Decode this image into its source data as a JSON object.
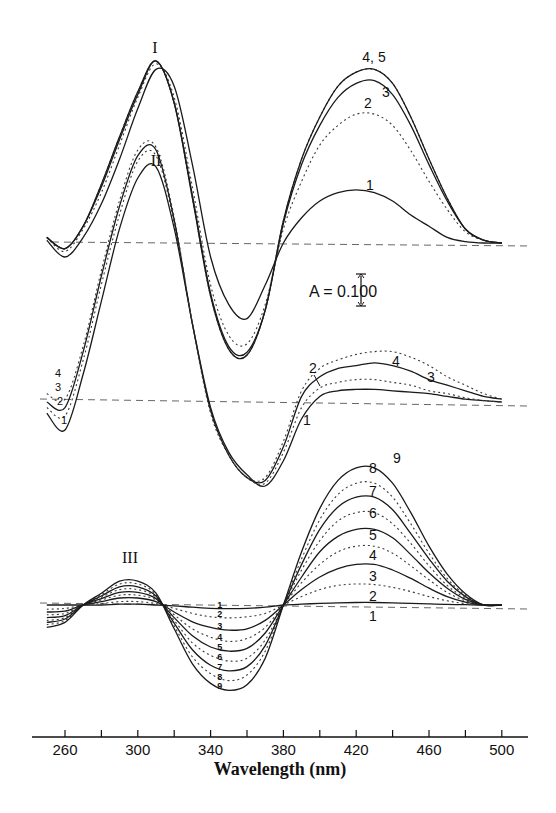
{
  "chart_data": {
    "type": "line",
    "title": "",
    "xlabel": "Wavelength (nm)",
    "ylabel": "",
    "xlim": [
      245,
      510
    ],
    "x_ticks": [
      260,
      280,
      300,
      320,
      340,
      360,
      380,
      400,
      420,
      440,
      460,
      480,
      500
    ],
    "x_tick_labels": [
      "260",
      "300",
      "340",
      "380",
      "420",
      "460",
      "500"
    ],
    "grid": false,
    "legend": "none (curves numbered inline)",
    "scale_bar": {
      "label": "A = 0.100",
      "absorbance": 0.1
    },
    "units_note": "Difference absorbance spectra, vertically offset; y-values are absorbance relative to each panel's dashed baseline",
    "panels": [
      {
        "name": "I",
        "baseline_offset": 0.0,
        "x": [
          250,
          260,
          270,
          280,
          290,
          300,
          310,
          320,
          330,
          340,
          350,
          360,
          370,
          380,
          390,
          400,
          410,
          420,
          430,
          440,
          450,
          460,
          470,
          480,
          490,
          500
        ],
        "series": [
          {
            "name": "1",
            "style": "solid",
            "values": [
              0.01,
              -0.05,
              0.02,
              0.14,
              0.3,
              0.48,
              0.62,
              0.56,
              0.28,
              -0.05,
              -0.22,
              -0.27,
              -0.15,
              0.0,
              0.09,
              0.15,
              0.18,
              0.19,
              0.18,
              0.15,
              0.1,
              0.06,
              0.02,
              0.005,
              0.0,
              0.0
            ]
          },
          {
            "name": "2",
            "style": "dotted",
            "values": [
              0.02,
              -0.03,
              0.05,
              0.18,
              0.35,
              0.52,
              0.64,
              0.52,
              0.2,
              -0.15,
              -0.33,
              -0.36,
              -0.22,
              0.05,
              0.22,
              0.35,
              0.42,
              0.46,
              0.46,
              0.42,
              0.33,
              0.22,
              0.12,
              0.04,
              0.01,
              0.0
            ]
          },
          {
            "name": "3",
            "style": "solid",
            "values": [
              0.02,
              -0.02,
              0.06,
              0.2,
              0.37,
              0.53,
              0.65,
              0.5,
              0.17,
              -0.18,
              -0.37,
              -0.39,
              -0.24,
              0.07,
              0.28,
              0.42,
              0.52,
              0.57,
              0.58,
              0.53,
              0.42,
              0.28,
              0.15,
              0.05,
              0.01,
              0.0
            ]
          },
          {
            "name": "4",
            "style": "dotted",
            "values": [
              0.02,
              -0.02,
              0.06,
              0.21,
              0.38,
              0.54,
              0.65,
              0.5,
              0.16,
              -0.19,
              -0.38,
              -0.4,
              -0.24,
              0.08,
              0.3,
              0.45,
              0.56,
              0.61,
              0.62,
              0.57,
              0.45,
              0.3,
              0.16,
              0.05,
              0.01,
              0.0
            ]
          },
          {
            "name": "5",
            "style": "solid",
            "values": [
              0.02,
              -0.02,
              0.06,
              0.21,
              0.38,
              0.54,
              0.65,
              0.5,
              0.16,
              -0.19,
              -0.38,
              -0.4,
              -0.24,
              0.08,
              0.3,
              0.45,
              0.56,
              0.61,
              0.62,
              0.57,
              0.45,
              0.3,
              0.16,
              0.05,
              0.01,
              0.0
            ]
          }
        ]
      },
      {
        "name": "II",
        "baseline_offset": -0.57,
        "x": [
          250,
          260,
          270,
          280,
          290,
          300,
          310,
          320,
          330,
          340,
          350,
          360,
          370,
          380,
          390,
          400,
          410,
          420,
          430,
          440,
          450,
          460,
          470,
          480,
          490,
          500
        ],
        "series": [
          {
            "name": "1",
            "style": "solid",
            "values": [
              -0.04,
              -0.1,
              0.1,
              0.36,
              0.62,
              0.8,
              0.84,
              0.62,
              0.28,
              -0.02,
              -0.18,
              -0.26,
              -0.3,
              -0.21,
              -0.06,
              0.02,
              0.04,
              0.045,
              0.045,
              0.04,
              0.035,
              0.03,
              0.02,
              0.01,
              0.005,
              0.0
            ]
          },
          {
            "name": "2",
            "style": "dotted",
            "values": [
              -0.02,
              -0.05,
              0.15,
              0.42,
              0.67,
              0.86,
              0.88,
              0.64,
              0.28,
              -0.03,
              -0.19,
              -0.27,
              -0.29,
              -0.18,
              -0.02,
              0.05,
              0.07,
              0.08,
              0.08,
              0.07,
              0.06,
              0.04,
              0.03,
              0.015,
              0.005,
              0.0
            ]
          },
          {
            "name": "3",
            "style": "solid",
            "values": [
              0.0,
              -0.02,
              0.18,
              0.45,
              0.7,
              0.88,
              0.9,
              0.65,
              0.28,
              -0.03,
              -0.19,
              -0.27,
              -0.28,
              -0.16,
              0.02,
              0.09,
              0.12,
              0.13,
              0.14,
              0.13,
              0.11,
              0.08,
              0.06,
              0.04,
              0.02,
              0.01
            ]
          },
          {
            "name": "4",
            "style": "dotted",
            "values": [
              0.03,
              0.01,
              0.2,
              0.47,
              0.72,
              0.9,
              0.91,
              0.66,
              0.28,
              -0.04,
              -0.19,
              -0.27,
              -0.27,
              -0.14,
              0.04,
              0.12,
              0.15,
              0.17,
              0.18,
              0.18,
              0.16,
              0.13,
              0.09,
              0.06,
              0.03,
              0.01
            ]
          }
        ]
      },
      {
        "name": "III",
        "baseline_offset": -1.29,
        "x": [
          250,
          260,
          270,
          280,
          290,
          300,
          310,
          320,
          330,
          340,
          350,
          360,
          370,
          380,
          390,
          400,
          410,
          420,
          430,
          440,
          450,
          460,
          470,
          480,
          490,
          500
        ],
        "series": [
          {
            "name": "1",
            "style": "solid",
            "values": [
              0.0,
              0.0,
              0.0,
              0.0,
              0.003,
              0.003,
              0.0,
              -0.003,
              -0.008,
              -0.012,
              -0.013,
              -0.012,
              -0.008,
              0.0,
              0.003,
              0.006,
              0.008,
              0.009,
              0.009,
              0.008,
              0.006,
              0.004,
              0.002,
              0.001,
              0.0,
              0.0
            ]
          },
          {
            "name": "2",
            "style": "dotted",
            "values": [
              -0.015,
              -0.012,
              0.0,
              0.005,
              0.012,
              0.012,
              0.005,
              -0.012,
              -0.03,
              -0.042,
              -0.046,
              -0.042,
              -0.03,
              0.0,
              0.03,
              0.055,
              0.07,
              0.075,
              0.073,
              0.063,
              0.048,
              0.03,
              0.015,
              0.005,
              0.0,
              0.0
            ]
          },
          {
            "name": "3",
            "style": "solid",
            "values": [
              -0.025,
              -0.022,
              0.0,
              0.012,
              0.025,
              0.025,
              0.012,
              -0.025,
              -0.06,
              -0.08,
              -0.09,
              -0.085,
              -0.055,
              0.0,
              0.055,
              0.1,
              0.13,
              0.145,
              0.145,
              0.125,
              0.095,
              0.06,
              0.03,
              0.01,
              0.0,
              0.0
            ]
          },
          {
            "name": "4",
            "style": "dotted",
            "values": [
              -0.035,
              -0.03,
              0.0,
              0.018,
              0.035,
              0.035,
              0.018,
              -0.035,
              -0.085,
              -0.115,
              -0.13,
              -0.12,
              -0.08,
              0.0,
              0.08,
              0.145,
              0.19,
              0.21,
              0.21,
              0.185,
              0.14,
              0.09,
              0.045,
              0.015,
              0.0,
              0.0
            ]
          },
          {
            "name": "5",
            "style": "solid",
            "values": [
              -0.045,
              -0.038,
              0.0,
              0.023,
              0.045,
              0.045,
              0.023,
              -0.045,
              -0.11,
              -0.15,
              -0.165,
              -0.155,
              -0.1,
              0.0,
              0.1,
              0.19,
              0.245,
              0.27,
              0.27,
              0.24,
              0.18,
              0.115,
              0.06,
              0.02,
              0.0,
              0.0
            ]
          },
          {
            "name": "6",
            "style": "dotted",
            "values": [
              -0.055,
              -0.045,
              0.0,
              0.028,
              0.055,
              0.055,
              0.028,
              -0.055,
              -0.135,
              -0.18,
              -0.2,
              -0.19,
              -0.125,
              0.0,
              0.125,
              0.23,
              0.3,
              0.33,
              0.33,
              0.29,
              0.22,
              0.14,
              0.07,
              0.025,
              0.0,
              0.0
            ]
          },
          {
            "name": "7",
            "style": "solid",
            "values": [
              -0.062,
              -0.05,
              0.0,
              0.032,
              0.065,
              0.065,
              0.032,
              -0.065,
              -0.16,
              -0.215,
              -0.235,
              -0.22,
              -0.145,
              0.0,
              0.145,
              0.27,
              0.35,
              0.385,
              0.385,
              0.34,
              0.255,
              0.165,
              0.085,
              0.03,
              0.0,
              0.0
            ]
          },
          {
            "name": "8",
            "style": "dotted",
            "values": [
              -0.07,
              -0.056,
              0.0,
              0.037,
              0.075,
              0.075,
              0.037,
              -0.075,
              -0.185,
              -0.245,
              -0.27,
              -0.25,
              -0.165,
              0.0,
              0.165,
              0.305,
              0.395,
              0.435,
              0.435,
              0.385,
              0.29,
              0.185,
              0.095,
              0.035,
              0.0,
              0.0
            ]
          },
          {
            "name": "9",
            "style": "solid",
            "values": [
              -0.08,
              -0.062,
              0.0,
              0.042,
              0.085,
              0.085,
              0.042,
              -0.085,
              -0.21,
              -0.28,
              -0.305,
              -0.285,
              -0.19,
              0.0,
              0.19,
              0.345,
              0.445,
              0.49,
              0.49,
              0.435,
              0.33,
              0.21,
              0.11,
              0.04,
              0.0,
              0.0
            ]
          }
        ]
      }
    ]
  },
  "labels": {
    "group_I": "I",
    "group_II": "II",
    "group_III": "III",
    "scale_bar": "A = 0.100",
    "xlabel": "Wavelength (nm)",
    "panel_I_right": [
      "4, 5",
      "3",
      "2",
      "1"
    ],
    "panel_II_left": [
      "4",
      "3",
      "2",
      "1"
    ],
    "panel_II_right": [
      "2",
      "4",
      "3",
      "1"
    ],
    "panel_III_right": [
      "9",
      "8",
      "7",
      "6",
      "5",
      "4",
      "3",
      "2",
      "1"
    ],
    "panel_III_min": [
      "1",
      "2",
      "3",
      "4",
      "5",
      "6",
      "7",
      "8",
      "9"
    ]
  },
  "axis": {
    "ticks": [
      {
        "value": 260,
        "label": "260"
      },
      {
        "value": 280,
        "label": ""
      },
      {
        "value": 300,
        "label": "300"
      },
      {
        "value": 320,
        "label": ""
      },
      {
        "value": 340,
        "label": "340"
      },
      {
        "value": 360,
        "label": ""
      },
      {
        "value": 380,
        "label": "380"
      },
      {
        "value": 400,
        "label": ""
      },
      {
        "value": 420,
        "label": "420"
      },
      {
        "value": 440,
        "label": ""
      },
      {
        "value": 460,
        "label": "460"
      },
      {
        "value": 480,
        "label": ""
      },
      {
        "value": 500,
        "label": "500"
      }
    ]
  }
}
